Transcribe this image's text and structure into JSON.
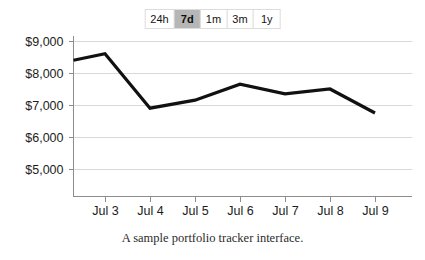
{
  "range_toggle": {
    "options": [
      {
        "label": "24h",
        "selected": false
      },
      {
        "label": "7d",
        "selected": true
      },
      {
        "label": "1m",
        "selected": false
      },
      {
        "label": "3m",
        "selected": false
      },
      {
        "label": "1y",
        "selected": false
      }
    ],
    "selected_label": "7d",
    "selected_bg": "#b6b6b6",
    "track_bg": "#dcdcdc"
  },
  "caption": {
    "text": "A sample portfolio tracker interface."
  },
  "chart_data": {
    "type": "line",
    "title": "",
    "xlabel": "",
    "ylabel": "",
    "categories": [
      "Jul 3",
      "Jul 4",
      "Jul 5",
      "Jul 6",
      "Jul 7",
      "Jul 8",
      "Jul 9"
    ],
    "values": [
      8600,
      6900,
      7150,
      7650,
      7350,
      7500,
      6750
    ],
    "lead_in_value": 8400,
    "series": [
      {
        "name": "Portfolio value",
        "color": "#111111",
        "values": [
          8600,
          6900,
          7150,
          7650,
          7350,
          7500,
          6750
        ]
      }
    ],
    "ylim": [
      4500,
      9250
    ],
    "yticks": [
      5000,
      6000,
      7000,
      8000,
      9000
    ],
    "ytick_labels": [
      "$5,000",
      "$6,000",
      "$7,000",
      "$8,000",
      "$9,000"
    ],
    "grid": true,
    "grid_color": "#d9d9d9",
    "legend": false,
    "axis_color": "#8d8d8d"
  }
}
